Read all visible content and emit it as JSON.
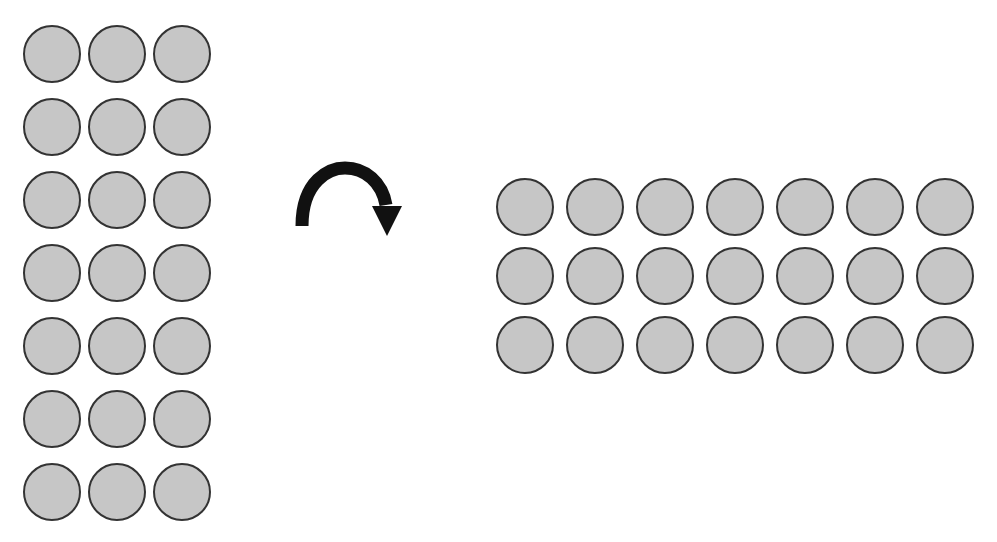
{
  "diagram": {
    "left_array": {
      "rows": 7,
      "columns": 3,
      "count": 21
    },
    "right_array": {
      "rows": 3,
      "columns": 7,
      "count": 21
    },
    "arrow": {
      "icon": "curved-arrow-clockwise-icon",
      "direction": "clockwise"
    },
    "colors": {
      "circle_fill": "#c6c6c6",
      "circle_stroke": "#333333",
      "arrow": "#111111",
      "background": "#ffffff"
    }
  }
}
